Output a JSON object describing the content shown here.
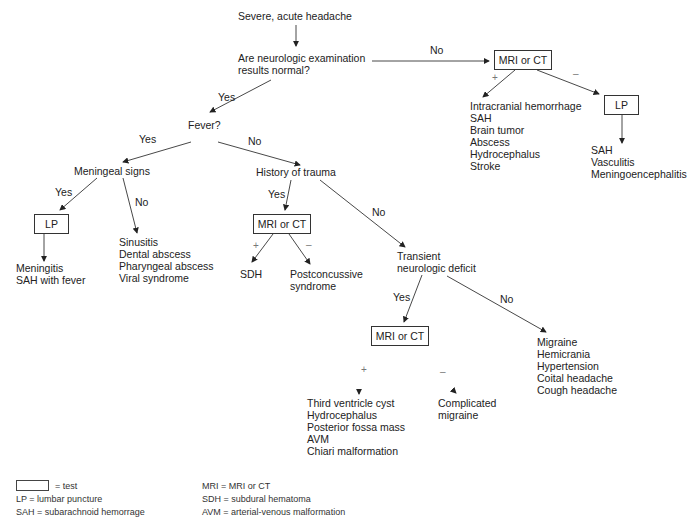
{
  "diagram": {
    "start": "Severe, acute headache",
    "q_neuro_line1": "Are neurologic examination",
    "q_neuro_line2": "results normal?",
    "no": "No",
    "yes": "Yes",
    "plus": "+",
    "minus": "–",
    "mri_ct": "MRI or CT",
    "lp": "LP",
    "abnormal_positive": [
      "Intracranial hemorrhage",
      "SAH",
      "Brain tumor",
      "Abscess",
      "Hydrocephalus",
      "Stroke"
    ],
    "abnormal_lp_results": [
      "SAH",
      "Vasculitis",
      "Meningoencephalitis"
    ],
    "fever": "Fever?",
    "meningeal_signs": "Meningeal signs",
    "meningeal_yes_results": [
      "Meningitis",
      "SAH with fever"
    ],
    "meningeal_no_results": [
      "Sinusitis",
      "Dental abscess",
      "Pharyngeal abscess",
      "Viral syndrome"
    ],
    "history_trauma": "History of trauma",
    "trauma_positive": "SDH",
    "trauma_negative": [
      "Postconcussive",
      "syndrome"
    ],
    "transient_line1": "Transient",
    "transient_line2": "neurologic deficit",
    "transient_positive": [
      "Third ventricle cyst",
      "Hydrocephalus",
      "Posterior fossa mass",
      "AVM",
      "Chiari malformation"
    ],
    "transient_negative": [
      "Complicated",
      "migraine"
    ],
    "transient_no_results": [
      "Migraine",
      "Hemicrania",
      "Hypertension",
      "Coital headache",
      "Cough headache"
    ]
  },
  "legend": {
    "test": "= test",
    "lp": "LP = lumbar puncture",
    "sah": "SAH = subarachnoid hemorrage",
    "mri": "MRI = MRI or CT",
    "sdh": "SDH = subdural hematoma",
    "avm": "AVM = arterial-venous malformation"
  }
}
